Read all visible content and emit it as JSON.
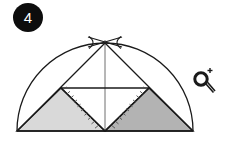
{
  "page": {
    "background_color": "#ffffff",
    "width": 227,
    "height": 146
  },
  "step_badge": {
    "number": "4",
    "background_color": "#0d0d0d",
    "text_color": "#ffffff",
    "cx": 28,
    "cy": 17,
    "r": 15
  },
  "zoom_icon": {
    "name": "magnifier-zoom-in-icon",
    "label": "+",
    "color": "#1a1a1a",
    "lens_cx": 201,
    "lens_cy": 79,
    "lens_r": 6.2,
    "handle": {
      "x1": 205.5,
      "y1": 83.5,
      "x2": 213,
      "y2": 92
    },
    "plus": {
      "x": 210,
      "y": 70,
      "size": 5
    }
  },
  "figure": {
    "name": "semicircle-construction",
    "stroke_color": "#1a1a1a",
    "thin_stroke_color": "#555555",
    "fill_light": "#d9d9d9",
    "fill_dark": "#b3b3b3",
    "baseline": {
      "x1": 17,
      "y1": 131,
      "x2": 193,
      "y2": 131
    },
    "center": {
      "x": 105,
      "y": 131
    },
    "radius": 88,
    "apex": {
      "x": 105,
      "y": 43
    },
    "arc_path": "M 17 131 A 88 88 0 0 1 193 131",
    "mid_left": {
      "x": 61,
      "y": 88
    },
    "mid_right": {
      "x": 149,
      "y": 88
    },
    "vertical_axis": {
      "x1": 105,
      "y1": 43,
      "x2": 105,
      "y2": 131
    },
    "horizontal_chord": {
      "x1": 61,
      "y1": 88,
      "x2": 149,
      "y2": 88
    },
    "triangles": [
      {
        "name": "left-shaded-triangle",
        "points": "17,131 61,88 105,131",
        "fill": "#d9d9d9"
      },
      {
        "name": "right-shaded-triangle",
        "points": "105,131 149,88 193,131",
        "fill": "#b3b3b3"
      }
    ],
    "diagonals": [
      {
        "name": "diagonal-left-base-to-apex",
        "x1": 17,
        "y1": 131,
        "x2": 105,
        "y2": 43
      },
      {
        "name": "diagonal-right-base-to-apex",
        "x1": 193,
        "y1": 131,
        "x2": 105,
        "y2": 43
      },
      {
        "name": "diagonal-left-mid-to-center",
        "x1": 61,
        "y1": 88,
        "x2": 105,
        "y2": 131
      },
      {
        "name": "diagonal-right-mid-to-center",
        "x1": 149,
        "y1": 88,
        "x2": 105,
        "y2": 131
      }
    ],
    "tick_marked_edges": [
      {
        "name": "tick-edge-left",
        "x1": 61,
        "y1": 88,
        "x2": 105,
        "y2": 131
      },
      {
        "name": "tick-edge-right",
        "x1": 105,
        "y1": 131,
        "x2": 149,
        "y2": 88
      }
    ],
    "apex_cross_marks": [
      {
        "name": "apex-arc-mark-left",
        "d": "M 90 38 Q 98 43 90 48"
      },
      {
        "name": "apex-arc-mark-right",
        "d": "M 120 38 Q 112 43 120 48"
      }
    ]
  }
}
